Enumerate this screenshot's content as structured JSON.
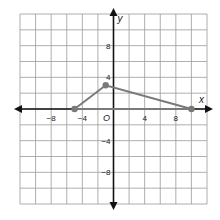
{
  "graph": {
    "x_axis_label": "x",
    "y_axis_label": "y",
    "origin_label": "O",
    "x_tick_labels": [
      {
        "value": -8,
        "label": "−8"
      },
      {
        "value": -4,
        "label": "−4"
      },
      {
        "value": 4,
        "label": "4"
      },
      {
        "value": 8,
        "label": "8"
      }
    ],
    "y_tick_labels": [
      {
        "value": 8,
        "label": "8"
      },
      {
        "value": 4,
        "label": "4"
      },
      {
        "value": -4,
        "label": "−4"
      },
      {
        "value": -8,
        "label": "−8"
      }
    ],
    "range": {
      "xmin": -12,
      "xmax": 12,
      "ymin": -12,
      "ymax": 12
    },
    "grid_step": 2,
    "points": [
      {
        "x": -5,
        "y": 0
      },
      {
        "x": -1,
        "y": 3
      },
      {
        "x": 10,
        "y": 0
      }
    ],
    "colors": {
      "grid": "#9a9a9a",
      "axis": "#111111",
      "figure": "#7a7a7a",
      "point": "#7a7a7a"
    }
  }
}
